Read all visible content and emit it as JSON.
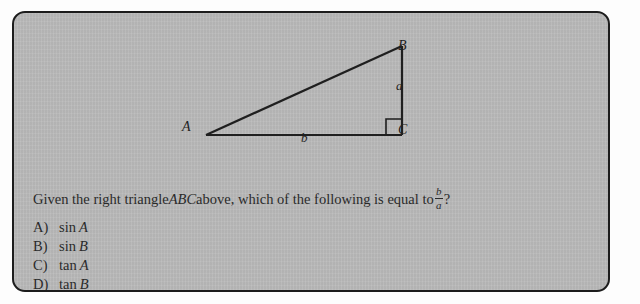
{
  "card": {
    "background_color": "#b9b9b9",
    "border_color": "#1c1c1c",
    "text_color": "#2a2a2a"
  },
  "figure": {
    "name": "right-triangle-ABC",
    "vertices": [
      {
        "id": "A",
        "label": "A",
        "x": 42,
        "y": 112
      },
      {
        "id": "B",
        "label": "B",
        "x": 238,
        "y": 23
      },
      {
        "id": "C",
        "label": "C",
        "x": 238,
        "y": 112
      }
    ],
    "sides": [
      {
        "id": "a",
        "label": "a",
        "between": "B-C"
      },
      {
        "id": "b",
        "label": "b",
        "between": "A-C"
      }
    ],
    "right_angle_at": "C",
    "stroke_color": "#1f1f1f"
  },
  "question": {
    "part1": "Given the right triangle ",
    "triangle_name": "ABC",
    "part2": " above, which of the following is equal to ",
    "fraction": {
      "numerator": "b",
      "denominator": "a"
    },
    "part3": "?"
  },
  "choices": [
    {
      "letter": "A)",
      "function": "sin",
      "argument": "A"
    },
    {
      "letter": "B)",
      "function": "sin",
      "argument": "B"
    },
    {
      "letter": "C)",
      "function": "tan",
      "argument": "A"
    },
    {
      "letter": "D)",
      "function": "tan",
      "argument": "B"
    }
  ]
}
